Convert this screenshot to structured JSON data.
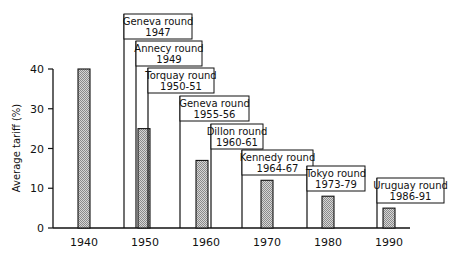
{
  "chart_data": {
    "type": "bar",
    "title": "",
    "xlabel": "",
    "ylabel": "Average tariff (%)",
    "ylim": [
      0,
      40
    ],
    "yticks": [
      0,
      10,
      20,
      30,
      40
    ],
    "xticks": [
      "1940",
      "1950",
      "1960",
      "1970",
      "1980",
      "1990"
    ],
    "grid": false,
    "bars": [
      {
        "x": 1940,
        "value": 40
      },
      {
        "x": 1950,
        "value": 25
      },
      {
        "x": 1960,
        "value": 17
      },
      {
        "x": 1970,
        "value": 12
      },
      {
        "x": 1980,
        "value": 8
      },
      {
        "x": 1990,
        "value": 5
      }
    ],
    "annotations": [
      {
        "name": "Geneva round",
        "years": "1947"
      },
      {
        "name": "Annecy round",
        "years": "1949"
      },
      {
        "name": "Torquay round",
        "years": "1950-51"
      },
      {
        "name": "Geneva round",
        "years": "1955-56"
      },
      {
        "name": "Dillon round",
        "years": "1960-61"
      },
      {
        "name": "Kennedy round",
        "years": "1964-67"
      },
      {
        "name": "Tokyo round",
        "years": "1973-79"
      },
      {
        "name": "Uruguay round",
        "years": "1986-91"
      }
    ]
  },
  "colors": {
    "bar_fill": "#bdbdbd",
    "line": "#111111"
  }
}
